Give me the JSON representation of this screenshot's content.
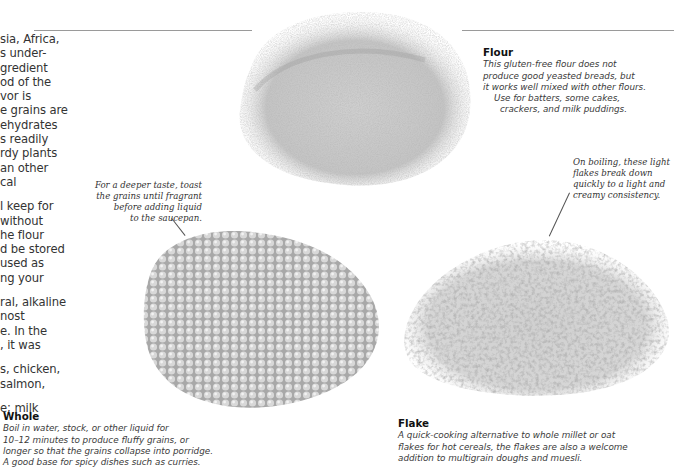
{
  "body_text": {
    "lines": [
      "sia, Africa,",
      "s under-",
      "gredient",
      "od of the",
      "vor is",
      "e grains are",
      "ehydrates",
      "s readily",
      "rdy plants",
      "an other",
      "cal",
      "",
      "l keep for",
      " without",
      "he flour",
      "d be stored",
      " used as",
      "ng your",
      "",
      "ral, alkaline",
      "nost",
      "e. In the",
      ", it was",
      "",
      "s, chicken,",
      " salmon,",
      "",
      "e; milk"
    ]
  },
  "images": {
    "flour": "flour-pile-photo",
    "whole": "whole-millet-grains-photo",
    "flake": "millet-flakes-photo"
  },
  "annotations": {
    "toast": [
      "For a deeper taste, toast",
      "the grains until fragrant",
      "before adding liquid",
      "to the saucepan."
    ],
    "boiling": [
      "On boiling, these light",
      "flakes break down",
      "quickly to a light and",
      "creamy consistency."
    ]
  },
  "captions": {
    "flour": {
      "title": "Flour",
      "lines": [
        "This gluten-free flour does not",
        "produce good yeasted breads, but",
        "it works well mixed with other flours.",
        "Use for batters, some cakes,",
        "crackers, and milk puddings."
      ]
    },
    "whole": {
      "title": "Whole",
      "lines": [
        "Boil in water, stock, or other liquid for",
        "10–12 minutes to produce fluffy grains, or",
        "longer so that the grains collapse into porridge.",
        "A good base for spicy dishes such as curries."
      ]
    },
    "flake": {
      "title": "Flake",
      "lines": [
        "A quick-cooking alternative to whole millet or oat",
        "flakes for hot cereals, the flakes are also a welcome",
        "addition to multigrain doughs and muesli."
      ]
    }
  }
}
